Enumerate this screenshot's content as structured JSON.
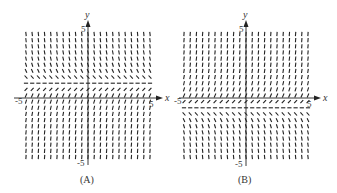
{
  "chart_data": [
    {
      "type": "slope-field",
      "panel_label": "(A)",
      "xlabel": "x",
      "ylabel": "y",
      "xlim": [
        -5,
        5
      ],
      "ylim": [
        -5,
        5
      ],
      "x_tick_labels": [
        "-5",
        "5"
      ],
      "y_tick_labels": [
        "5",
        "-5"
      ],
      "grid_points": 21,
      "description": "Slopes depend only on y: steep negative above, horizontal near y = 1, steep positive below",
      "slope_rule": {
        "depends_on": "y",
        "equilibrium_y": 1,
        "sign_above": -1
      }
    },
    {
      "type": "slope-field",
      "panel_label": "(B)",
      "xlabel": "x",
      "ylabel": "y",
      "xlim": [
        -5,
        5
      ],
      "ylim": [
        -5,
        5
      ],
      "x_tick_labels": [
        "-5",
        "5"
      ],
      "y_tick_labels": [
        "5",
        "-5"
      ],
      "grid_points": 21,
      "description": "Slopes depend only on y: steep positive above, horizontal near y = -1, steep negative below",
      "slope_rule": {
        "depends_on": "y",
        "equilibrium_y": -1,
        "sign_above": 1
      }
    }
  ],
  "colors": {
    "ink": "#222222",
    "label": "#333333"
  }
}
